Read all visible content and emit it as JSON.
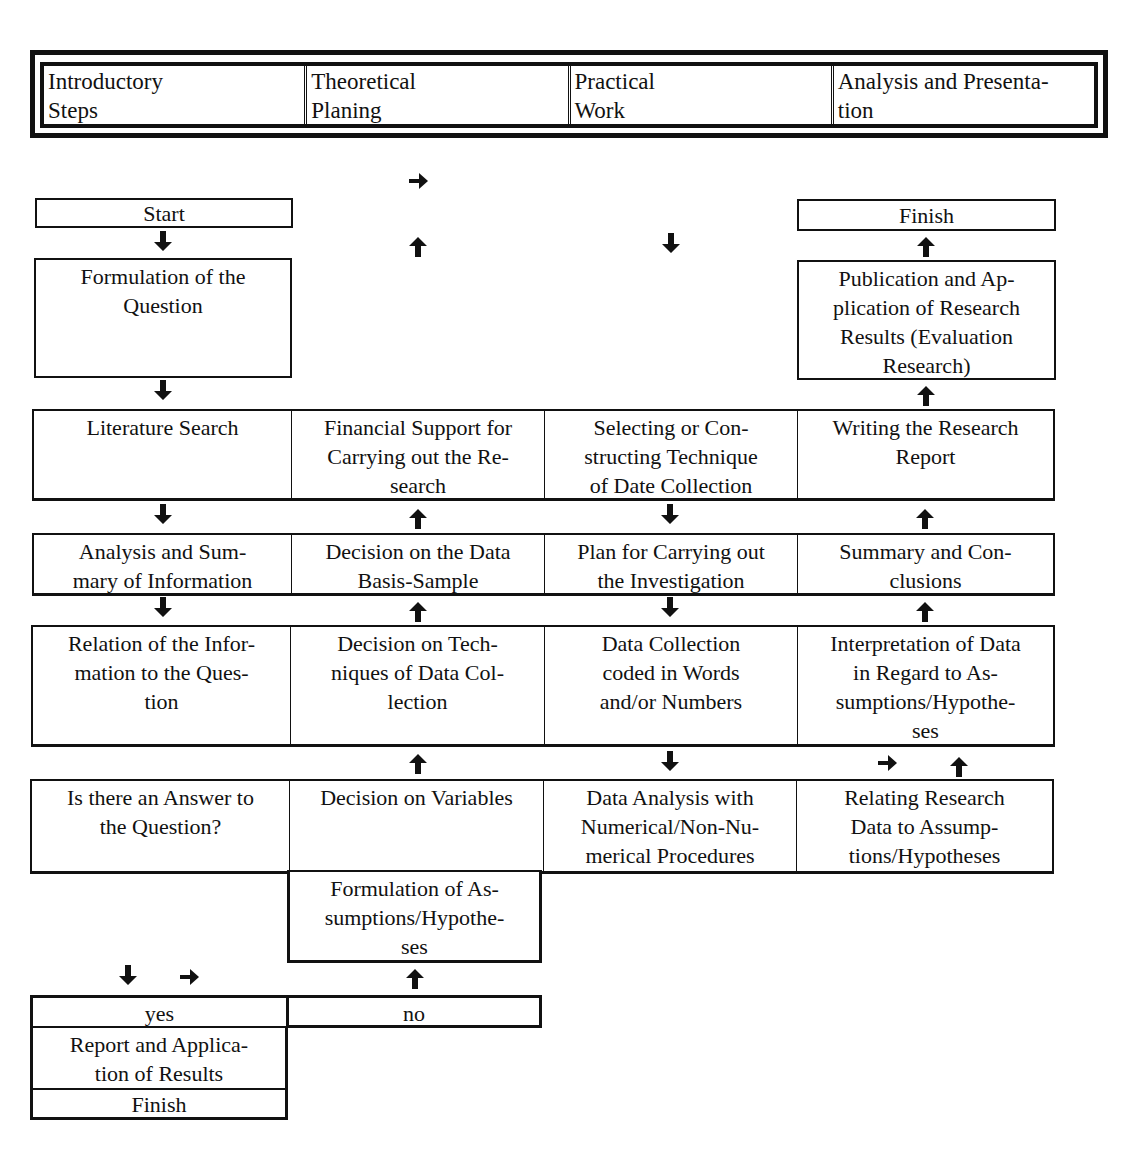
{
  "header": {
    "phases": [
      "Introductory\nSteps",
      "Theoretical\nPlaning",
      "Practical\nWork",
      "Analysis and Presenta-\ntion"
    ]
  },
  "flow": {
    "start": "Start",
    "formulation_question": "Formulation of the\nQuestion",
    "finish_top": "Finish",
    "publication": "Publication and Ap-\nplication of Research\nResults (Evaluation\nResearch)",
    "rows": [
      {
        "cells": [
          "Literature Search",
          "Financial Support for\nCarrying out the Re-\nsearch",
          "Selecting or Con-\nstructing Technique\nof Date Collection",
          "Writing the Research\nReport"
        ]
      },
      {
        "cells": [
          "Analysis and Sum-\nmary of Information",
          "Decision on the Data\nBasis-Sample",
          "Plan for Carrying out\nthe Investigation",
          "Summary and Con-\nclusions"
        ]
      },
      {
        "cells": [
          "Relation of the Infor-\nmation to the Ques-\ntion",
          "Decision on Tech-\nniques of Data Col-\nlection",
          "Data Collection\ncoded in Words\nand/or Numbers",
          "Interpretation of Data\nin Regard to As-\nsumptions/Hypothe-\nses"
        ]
      },
      {
        "cells": [
          "Is there an Answer to\nthe Question?",
          "Decision on Variables",
          "Data Analysis with\nNumerical/Non-Nu-\nmerical Procedures",
          "Relating Research\nData to Assump-\ntions/Hypotheses"
        ]
      }
    ],
    "formulation_assumptions": "Formulation of As-\nsumptions/Hypothe-\nses",
    "yes": "yes",
    "no": "no",
    "report_application": "Report and Applica-\ntion of Results",
    "finish_bottom": "Finish"
  },
  "arrows": {
    "right": "arrow-right-icon",
    "up": "arrow-up-icon",
    "down": "arrow-down-icon"
  }
}
